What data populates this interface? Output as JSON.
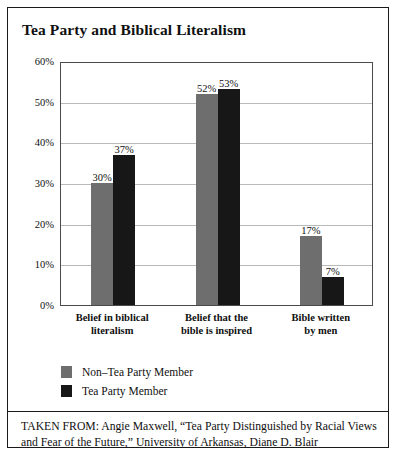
{
  "figure": {
    "title": "Tea Party and Biblical Literalism",
    "source_note": "TAKEN FROM: Angie Maxwell, “Tea Party Distinguished by Racial Views and Fear of the Future,” University of Arkansas, Diane D. Blair"
  },
  "colors": {
    "series_non_tea_party": "#6e6e6e",
    "series_tea_party": "#171717",
    "gridline": "#b9b9b9",
    "frame": "#1a1a1a",
    "text": "#101010"
  },
  "chart_data": {
    "type": "bar",
    "title": "Tea Party and Biblical Literalism",
    "xlabel": "",
    "ylabel": "",
    "ylim": [
      0,
      60
    ],
    "yticks": [
      0,
      10,
      20,
      30,
      40,
      50,
      60
    ],
    "ytick_labels": [
      "0%",
      "10%",
      "20%",
      "30%",
      "40%",
      "50%",
      "60%"
    ],
    "grid": true,
    "legend_position": "below-plot-left",
    "value_suffix": "%",
    "categories": [
      "Belief in biblical literalism",
      "Belief that the bible is inspired",
      "Bible written by men"
    ],
    "category_lines": [
      [
        "Belief in biblical",
        "literalism"
      ],
      [
        "Belief that the",
        "bible is inspired"
      ],
      [
        "Bible written",
        "by men"
      ]
    ],
    "series": [
      {
        "name": "Non–Tea Party Member",
        "color": "#6e6e6e",
        "values": [
          30,
          52,
          17
        ],
        "labels": [
          "30%",
          "52%",
          "17%"
        ]
      },
      {
        "name": "Tea Party Member",
        "color": "#171717",
        "values": [
          37,
          53,
          7
        ],
        "labels": [
          "37%",
          "53%",
          "7%"
        ]
      }
    ]
  }
}
